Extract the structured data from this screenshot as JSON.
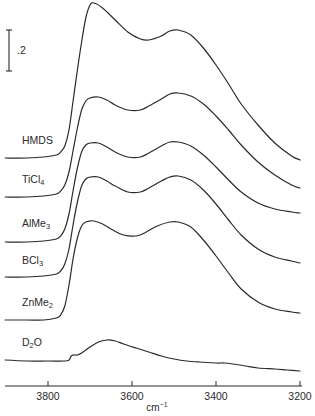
{
  "chart_data": {
    "type": "line",
    "title": "",
    "xlabel": "cm-1",
    "xlabel_base": "cm",
    "xlabel_sup": "−1",
    "ylabel": "",
    "x_reversed": true,
    "xlim": [
      3902,
      3200
    ],
    "x_ticks": [
      3800,
      3600,
      3400,
      3200
    ],
    "x_tick_labels": [
      "3800",
      "3600",
      "3400",
      "3200"
    ],
    "grid": false,
    "legend": "none (curves labeled inline at left)",
    "scale_bar": {
      "label": ".2",
      "value": 0.2,
      "units": "absorbance"
    },
    "series": [
      {
        "name": "HMDS",
        "label_base": "HMDS",
        "label_sub": "",
        "x": [
          3902,
          3850,
          3810,
          3780,
          3770,
          3760,
          3750,
          3740,
          3730,
          3720,
          3710,
          3700,
          3690,
          3670,
          3640,
          3610,
          3580,
          3560,
          3530,
          3510,
          3490,
          3460,
          3430,
          3400,
          3370,
          3340,
          3300,
          3260,
          3220,
          3200
        ],
        "y_px": [
          158,
          158,
          157,
          155,
          152,
          146,
          130,
          100,
          70,
          42,
          18,
          5,
          3,
          8,
          20,
          32,
          39,
          40,
          36,
          31,
          30,
          35,
          48,
          65,
          84,
          104,
          125,
          143,
          156,
          160
        ]
      },
      {
        "name": "TiCl4",
        "label_base": "TiCl",
        "label_sub": "4",
        "x": [
          3902,
          3850,
          3810,
          3780,
          3770,
          3760,
          3750,
          3740,
          3730,
          3720,
          3710,
          3700,
          3680,
          3660,
          3640,
          3610,
          3580,
          3560,
          3530,
          3510,
          3490,
          3460,
          3430,
          3400,
          3370,
          3340,
          3300,
          3260,
          3220,
          3200
        ],
        "y_px": [
          197,
          197,
          196,
          194,
          191,
          185,
          172,
          150,
          128,
          110,
          101,
          98,
          97,
          100,
          105,
          110,
          110,
          106,
          99,
          94,
          93,
          96,
          104,
          116,
          130,
          145,
          162,
          175,
          185,
          188
        ]
      },
      {
        "name": "AlMe3",
        "label_base": "AlMe",
        "label_sub": "3",
        "x": [
          3902,
          3850,
          3810,
          3780,
          3770,
          3760,
          3750,
          3740,
          3730,
          3720,
          3710,
          3700,
          3680,
          3660,
          3640,
          3610,
          3580,
          3560,
          3530,
          3510,
          3490,
          3460,
          3430,
          3400,
          3370,
          3340,
          3300,
          3260,
          3220,
          3200
        ],
        "y_px": [
          242,
          242,
          241,
          239,
          236,
          229,
          214,
          190,
          168,
          152,
          145,
          143,
          143,
          147,
          152,
          157,
          157,
          153,
          146,
          142,
          142,
          146,
          155,
          167,
          180,
          192,
          203,
          209,
          212,
          213
        ]
      },
      {
        "name": "BCl3",
        "label_base": "BCl",
        "label_sub": "3",
        "x": [
          3902,
          3850,
          3810,
          3780,
          3770,
          3760,
          3750,
          3740,
          3730,
          3720,
          3710,
          3700,
          3680,
          3660,
          3640,
          3610,
          3580,
          3560,
          3530,
          3510,
          3490,
          3460,
          3430,
          3400,
          3370,
          3340,
          3300,
          3260,
          3220,
          3200
        ],
        "y_px": [
          277,
          277,
          276,
          274,
          271,
          264,
          249,
          224,
          202,
          186,
          179,
          177,
          177,
          181,
          186,
          192,
          192,
          188,
          181,
          177,
          176,
          180,
          190,
          204,
          220,
          235,
          249,
          257,
          261,
          263
        ]
      },
      {
        "name": "ZnMe2",
        "label_base": "ZnMe",
        "label_sub": "2",
        "x": [
          3902,
          3850,
          3810,
          3780,
          3770,
          3760,
          3750,
          3740,
          3730,
          3720,
          3710,
          3700,
          3690,
          3670,
          3650,
          3620,
          3590,
          3570,
          3540,
          3510,
          3490,
          3460,
          3430,
          3400,
          3370,
          3340,
          3300,
          3260,
          3220,
          3200
        ],
        "y_px": [
          320,
          320,
          320,
          318,
          315,
          306,
          285,
          258,
          238,
          226,
          222,
          221,
          221,
          224,
          229,
          235,
          236,
          233,
          226,
          222,
          222,
          227,
          240,
          256,
          273,
          289,
          302,
          309,
          312,
          313
        ]
      },
      {
        "name": "D2O",
        "label_base": "D",
        "label_sub": "2",
        "label_tail": "O",
        "x": [
          3902,
          3850,
          3800,
          3760,
          3750,
          3745,
          3740,
          3730,
          3720,
          3700,
          3680,
          3660,
          3640,
          3620,
          3590,
          3560,
          3530,
          3500,
          3470,
          3440,
          3400,
          3380,
          3360,
          3330,
          3300,
          3260,
          3230,
          3200
        ],
        "y_px": [
          360,
          361,
          361,
          361,
          360,
          356,
          355,
          355,
          353,
          347,
          342,
          340,
          341,
          344,
          348,
          352,
          356,
          359,
          361,
          362,
          363,
          363,
          364,
          366,
          368,
          369,
          370,
          371
        ]
      }
    ],
    "approx_peak_positions_cm-1": {
      "first_peak": 3690,
      "dip": 3580,
      "second_peak": 3500
    }
  },
  "labels": {
    "scale_bar": ".2",
    "xlabel_base": "cm",
    "xlabel_sup": "−1"
  }
}
